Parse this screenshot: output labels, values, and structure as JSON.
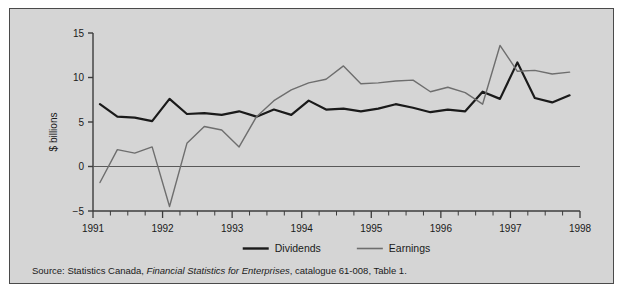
{
  "chart_data": {
    "type": "line",
    "title": "",
    "xlabel": "",
    "ylabel": "$ billions",
    "xlim": [
      1991.0,
      1998.0
    ],
    "ylim": [
      -5,
      15
    ],
    "yticks": [
      -5,
      0,
      5,
      10,
      15
    ],
    "ytick_labels": [
      "−5",
      "0",
      "5",
      "10",
      "15"
    ],
    "xticks": [
      1991,
      1992,
      1993,
      1994,
      1995,
      1996,
      1997,
      1998
    ],
    "xtick_labels": [
      "1991",
      "1992",
      "1993",
      "1994",
      "1995",
      "1996",
      "1997",
      "1998"
    ],
    "minor_tick_interval_years": 0.25,
    "grid": false,
    "zero_line": true,
    "legend_position": "bottom-center",
    "x": [
      1991.1,
      1991.35,
      1991.6,
      1991.85,
      1992.1,
      1992.35,
      1992.6,
      1992.85,
      1993.1,
      1993.35,
      1993.6,
      1993.85,
      1994.1,
      1994.35,
      1994.6,
      1994.85,
      1995.1,
      1995.35,
      1995.6,
      1995.85,
      1996.1,
      1996.35,
      1996.6,
      1996.85,
      1997.1,
      1997.35,
      1997.6,
      1997.85
    ],
    "series": [
      {
        "name": "Dividends",
        "color": "#1a1a1a",
        "width": 2.2,
        "values": [
          7.0,
          5.6,
          5.5,
          5.1,
          7.6,
          5.9,
          6.0,
          5.8,
          6.2,
          5.6,
          6.4,
          5.8,
          7.4,
          6.4,
          6.5,
          6.2,
          6.5,
          7.0,
          6.6,
          6.1,
          6.4,
          6.2,
          8.4,
          7.6,
          11.7,
          7.7,
          7.2,
          8.0
        ]
      },
      {
        "name": "Earnings",
        "color": "#6e6e6e",
        "width": 1.4,
        "values": [
          -1.8,
          1.9,
          1.5,
          2.2,
          -4.5,
          2.6,
          4.5,
          4.1,
          2.2,
          5.6,
          7.4,
          8.6,
          9.4,
          9.8,
          11.3,
          9.3,
          9.4,
          9.6,
          9.7,
          8.4,
          8.9,
          8.3,
          7.0,
          13.6,
          10.7,
          10.8,
          10.4,
          10.6
        ]
      }
    ]
  },
  "axis": {
    "y_label": "$ billions"
  },
  "legend": {
    "items": [
      {
        "label": "Dividends",
        "color": "#1a1a1a",
        "width": 2.4
      },
      {
        "label": "Earnings",
        "color": "#6e6e6e",
        "width": 1.6
      }
    ]
  },
  "source": {
    "prefix": "Source: Statistics Canada, ",
    "italic": "Financial Statistics for Enterprises",
    "suffix": ", catalogue 61-008, Table 1."
  },
  "colors": {
    "panel_background": "#d5d5d5",
    "page_background": "#ffffff",
    "panel_border": "#4a4a4a",
    "axis": "#3c3c3c",
    "dividends": "#1a1a1a",
    "earnings": "#6e6e6e"
  }
}
